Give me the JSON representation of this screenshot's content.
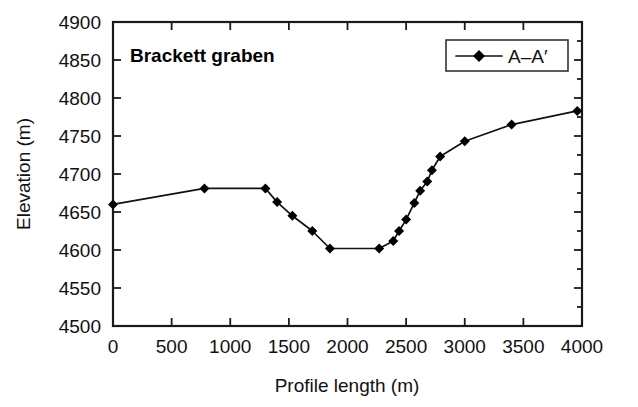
{
  "chart_data": {
    "type": "line",
    "title": "Brackett graben",
    "xlabel": "Profile length (m)",
    "ylabel": "Elevation (m)",
    "xlim": [
      0,
      4000
    ],
    "ylim": [
      4500,
      4900
    ],
    "xticks": [
      0,
      500,
      1000,
      1500,
      2000,
      2500,
      3000,
      3500,
      4000
    ],
    "xtick_labels": [
      "0",
      "500",
      "1000",
      "1500",
      "2000",
      "2500",
      "3000",
      "3500",
      "4000"
    ],
    "yticks": [
      4500,
      4550,
      4600,
      4650,
      4700,
      4750,
      4800,
      4850,
      4900
    ],
    "ytick_labels": [
      "4500",
      "4550",
      "4600",
      "4650",
      "4700",
      "4750",
      "4800",
      "4850",
      "4900"
    ],
    "grid": false,
    "legend_position": "top-right",
    "series": [
      {
        "name": "A–A′",
        "marker": "diamond",
        "color": "#000000",
        "x": [
          0,
          780,
          1300,
          1400,
          1530,
          1700,
          1850,
          2270,
          2390,
          2440,
          2500,
          2570,
          2620,
          2680,
          2720,
          2790,
          3000,
          3400,
          3960
        ],
        "y": [
          4660,
          4681,
          4681,
          4663,
          4645,
          4625,
          4602,
          4602,
          4612,
          4625,
          4640,
          4662,
          4678,
          4690,
          4705,
          4723,
          4743,
          4765,
          4783
        ]
      }
    ]
  },
  "legend": {
    "entries": [
      {
        "label": "A–A′"
      }
    ]
  },
  "annotations": {
    "title_text": "Brackett graben"
  }
}
